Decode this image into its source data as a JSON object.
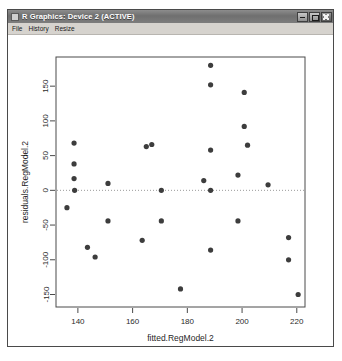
{
  "window": {
    "title": "R Graphics: Device 2 (ACTIVE)",
    "icon": "r-graphics-icon",
    "buttons": {
      "minimize": "minimize-icon",
      "maximize": "maximize-icon",
      "close": "close-icon"
    }
  },
  "menu": {
    "items": [
      {
        "label": "File"
      },
      {
        "label": "History"
      },
      {
        "label": "Resize"
      }
    ]
  },
  "colors": {
    "point": "#3d3d3d",
    "axis": "#4a4a4a",
    "zero_line": "#9a9a9a",
    "titlebar_text": "#ffffff",
    "menu_bg": "#d6d3ce",
    "plot_bg": "#ffffff"
  },
  "chart_data": {
    "type": "scatter",
    "title": "",
    "xlabel": "fitted.RegModel.2",
    "ylabel": "residuals.RegModel.2",
    "xlim": [
      132,
      223
    ],
    "ylim": [
      -168,
      192
    ],
    "xticks": [
      140,
      160,
      180,
      200,
      220
    ],
    "yticks": [
      150,
      100,
      50,
      0,
      -50,
      -100,
      -150
    ],
    "grid": false,
    "legend": null,
    "reference_line": {
      "orientation": "horizontal",
      "y": 0,
      "style": "dotted"
    },
    "point_symbol": "filled-circle",
    "points": [
      {
        "x": 136.0,
        "y": -25
      },
      {
        "x": 138.6,
        "y": 68
      },
      {
        "x": 138.6,
        "y": 38
      },
      {
        "x": 138.6,
        "y": 17
      },
      {
        "x": 138.8,
        "y": 0
      },
      {
        "x": 143.5,
        "y": -82
      },
      {
        "x": 146.3,
        "y": -96
      },
      {
        "x": 151.0,
        "y": 10
      },
      {
        "x": 151.0,
        "y": -44
      },
      {
        "x": 165.0,
        "y": 63
      },
      {
        "x": 167.0,
        "y": 66
      },
      {
        "x": 163.5,
        "y": -72
      },
      {
        "x": 170.5,
        "y": -44
      },
      {
        "x": 170.5,
        "y": 0
      },
      {
        "x": 177.5,
        "y": -142
      },
      {
        "x": 186.0,
        "y": 14
      },
      {
        "x": 188.5,
        "y": 180
      },
      {
        "x": 188.5,
        "y": 152
      },
      {
        "x": 188.5,
        "y": 58
      },
      {
        "x": 188.5,
        "y": 0
      },
      {
        "x": 188.5,
        "y": -86
      },
      {
        "x": 198.5,
        "y": 22
      },
      {
        "x": 198.5,
        "y": -44
      },
      {
        "x": 200.8,
        "y": 141
      },
      {
        "x": 200.8,
        "y": 92
      },
      {
        "x": 202.0,
        "y": 65
      },
      {
        "x": 209.5,
        "y": 8
      },
      {
        "x": 217.0,
        "y": -68
      },
      {
        "x": 217.0,
        "y": -100
      },
      {
        "x": 220.5,
        "y": -150
      }
    ]
  }
}
